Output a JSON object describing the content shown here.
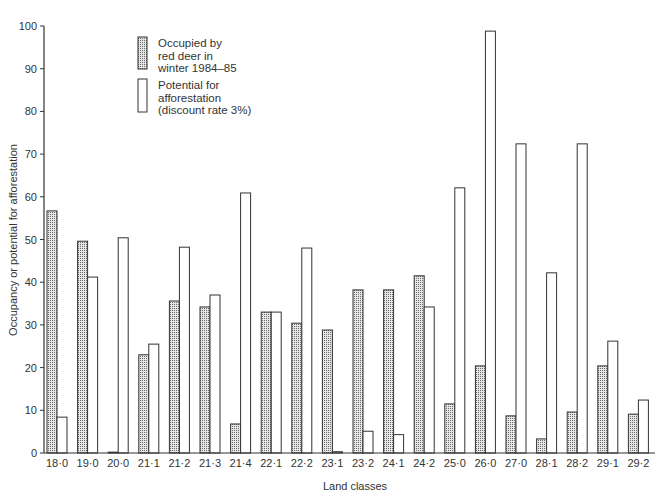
{
  "chart_data": {
    "type": "bar",
    "title": "",
    "xlabel": "Land classes",
    "ylabel": "Occupancy or potential for afforestation",
    "ylim": [
      0,
      100
    ],
    "yticks": [
      0,
      10,
      20,
      30,
      40,
      50,
      60,
      70,
      80,
      90,
      100
    ],
    "grid": false,
    "legend_position": "upper-left (inside plot)",
    "categories": [
      "18·0",
      "19·0",
      "20·0",
      "21·1",
      "21·2",
      "21·3",
      "21·4",
      "22·1",
      "22·2",
      "23·1",
      "23·2",
      "24·1",
      "24·2",
      "25·0",
      "26·0",
      "27·0",
      "28·1",
      "28·2",
      "29·1",
      "29·2"
    ],
    "series": [
      {
        "name": "Occupied by red deer in winter 1984–85",
        "legend_lines": [
          "Occupied by",
          "red deer in",
          "winter 1984–85"
        ],
        "pattern": "stippled",
        "values": [
          56.7,
          49.6,
          0.2,
          23.0,
          35.6,
          34.2,
          6.8,
          33.0,
          30.4,
          28.8,
          38.2,
          38.2,
          41.5,
          11.5,
          20.4,
          8.7,
          3.3,
          9.6,
          20.4,
          9.1
        ]
      },
      {
        "name": "Potential for afforestation (discount rate 3%)",
        "legend_lines": [
          "Potential for",
          "afforestation",
          "(discount rate 3%)"
        ],
        "pattern": "open",
        "values": [
          8.4,
          41.2,
          50.4,
          25.5,
          48.2,
          37.0,
          60.9,
          33.0,
          48.0,
          0.3,
          5.1,
          4.3,
          34.2,
          62.1,
          98.8,
          72.4,
          42.2,
          72.4,
          26.2,
          12.4
        ]
      }
    ]
  },
  "colors": {
    "stroke": "#333333",
    "stipple_fill": "#d8d8d8",
    "stipple_dot": "#555555",
    "open_fill": "#ffffff"
  }
}
